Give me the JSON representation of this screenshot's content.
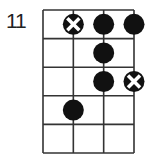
{
  "diagram": {
    "type": "chord-diagram",
    "start_fret_label": "11",
    "strings": 4,
    "frets_shown": 5,
    "colors": {
      "grid": "#333333",
      "dot": "#111111",
      "mark_x": "#ffffff"
    },
    "markers": [
      {
        "string": 2,
        "fret": 1,
        "type": "x"
      },
      {
        "string": 3,
        "fret": 1,
        "type": "dot"
      },
      {
        "string": 4,
        "fret": 1,
        "type": "dot"
      },
      {
        "string": 3,
        "fret": 2,
        "type": "dot"
      },
      {
        "string": 3,
        "fret": 3,
        "type": "dot"
      },
      {
        "string": 4,
        "fret": 3,
        "type": "x"
      },
      {
        "string": 2,
        "fret": 4,
        "type": "dot"
      }
    ]
  }
}
